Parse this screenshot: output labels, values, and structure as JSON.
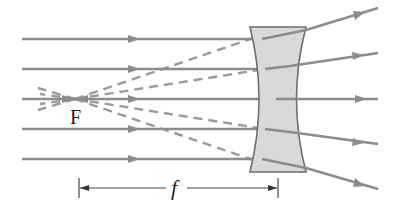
{
  "diagram": {
    "type": "optics-ray-diagram",
    "labels": {
      "focal_point": "F",
      "focal_length": "f"
    },
    "colors": {
      "ray": "#8c8c8c",
      "dashed_extension": "#9a9a9a",
      "lens_fill": "#d9d9d9",
      "lens_stroke": "#6e6e6e",
      "dimension_line": "#444444",
      "text": "#222222"
    },
    "focal_point": {
      "x": 75,
      "y": 99
    },
    "lens": {
      "top_y": 27,
      "bottom_y": 172,
      "outer_left_x": 250,
      "outer_right_x": 306,
      "waist_left_x": 263,
      "waist_right_x": 290
    },
    "incoming_rays_y": [
      39,
      69,
      99,
      129,
      159
    ],
    "outgoing_ray_end_y": [
      8,
      53,
      99,
      144,
      189
    ],
    "dimension": {
      "y": 188,
      "x_start": 79,
      "x_end": 278
    }
  }
}
